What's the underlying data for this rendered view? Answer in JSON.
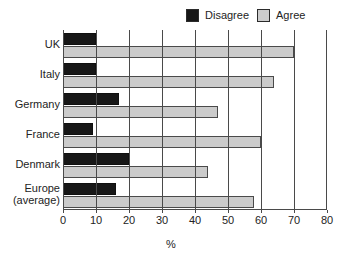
{
  "chart_data": {
    "type": "bar",
    "orientation": "horizontal",
    "title": "",
    "xlabel": "%",
    "ylabel": "",
    "xlim": [
      0,
      80
    ],
    "xticks": [
      0,
      10,
      20,
      30,
      40,
      50,
      60,
      70,
      80
    ],
    "grid": true,
    "legend_position": "top-right",
    "categories": [
      "UK",
      "Italy",
      "Germany",
      "France",
      "Denmark",
      "Europe (average)"
    ],
    "series": [
      {
        "name": "Disagree",
        "color": "#171717",
        "values": [
          10,
          10,
          17,
          9,
          20,
          16
        ]
      },
      {
        "name": "Agree",
        "color": "#cbcbcb",
        "values": [
          70,
          64,
          47,
          60,
          44,
          58
        ]
      }
    ]
  },
  "legend": {
    "entries": [
      {
        "label": "Disagree",
        "swatch": "disagree"
      },
      {
        "label": "Agree",
        "swatch": "agree"
      }
    ]
  },
  "axis": {
    "x_title": "%",
    "tick_labels": [
      "0",
      "10",
      "20",
      "30",
      "40",
      "50",
      "60",
      "70",
      "80"
    ]
  },
  "category_labels": [
    {
      "line1": "UK",
      "line2": ""
    },
    {
      "line1": "Italy",
      "line2": ""
    },
    {
      "line1": "Germany",
      "line2": ""
    },
    {
      "line1": "France",
      "line2": ""
    },
    {
      "line1": "Denmark",
      "line2": ""
    },
    {
      "line1": "Europe",
      "line2": "(average)"
    }
  ]
}
